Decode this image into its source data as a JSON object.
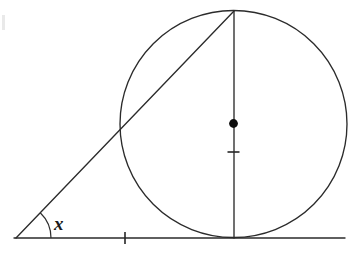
{
  "figure": {
    "background_color": "#ffffff",
    "stroke_color": "#2b2b2b",
    "width": 358,
    "height": 264
  },
  "labels": {
    "angle_x": "x"
  },
  "chart_data": {
    "type": "diagram",
    "shapes": [
      {
        "name": "circle",
        "type": "circle",
        "cx": 233.5,
        "cy": 124.0,
        "r": 113.5
      },
      {
        "name": "baseline",
        "type": "line",
        "x1": 14,
        "y1": 238,
        "x2": 345,
        "y2": 238
      },
      {
        "name": "hypotenuse",
        "type": "line",
        "x1": 16,
        "y1": 238,
        "x2": 234,
        "y2": 11
      },
      {
        "name": "vertical-diameter",
        "type": "line",
        "x1": 234,
        "y1": 11,
        "x2": 234,
        "y2": 238
      }
    ],
    "points": [
      {
        "name": "vertex",
        "x": 16,
        "y": 238,
        "label": "x"
      },
      {
        "name": "center",
        "x": 233.5,
        "y": 123.5,
        "marked": true
      },
      {
        "name": "top-tangency",
        "x": 234,
        "y": 11
      },
      {
        "name": "bottom-tangency",
        "x": 234,
        "y": 238
      }
    ],
    "ticks": [
      {
        "name": "baseline-tick",
        "x": 125,
        "y": 238,
        "orientation": "vertical",
        "length": 12
      },
      {
        "name": "radius-tick",
        "x": 233.5,
        "y": 152,
        "orientation": "horizontal",
        "length": 12
      }
    ],
    "angle_arc": {
      "name": "angle-x-arc",
      "vertex_x": 16,
      "vertex_y": 238,
      "radius": 35,
      "label": "x"
    },
    "label_positions": [
      {
        "label": "x",
        "x": 54,
        "y": 214
      }
    ]
  }
}
